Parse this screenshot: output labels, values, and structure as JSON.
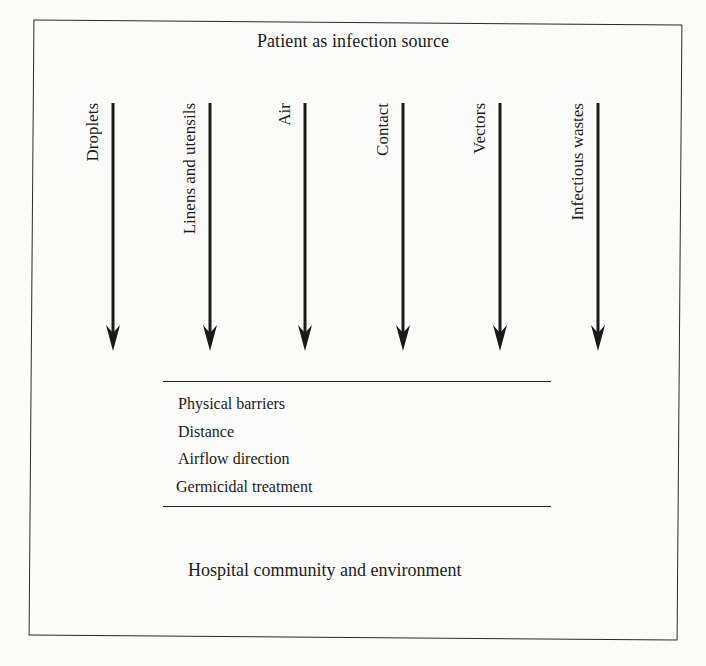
{
  "diagram": {
    "source_label": "Patient as infection source",
    "destination_label": "Hospital community and environment",
    "transmission_routes": [
      {
        "label": "Droplets",
        "x": 103
      },
      {
        "label": "Linens and utensils",
        "x": 200
      },
      {
        "label": "Air",
        "x": 295
      },
      {
        "label": "Contact",
        "x": 393
      },
      {
        "label": "Vectors",
        "x": 490
      },
      {
        "label": "Infectious wastes",
        "x": 588
      }
    ],
    "barriers": [
      "Physical barriers",
      "Distance",
      "Airflow direction",
      "Germicidal treatment"
    ],
    "colors": {
      "ink": "#1c1c1c",
      "paper": "#fbfbf9"
    }
  }
}
